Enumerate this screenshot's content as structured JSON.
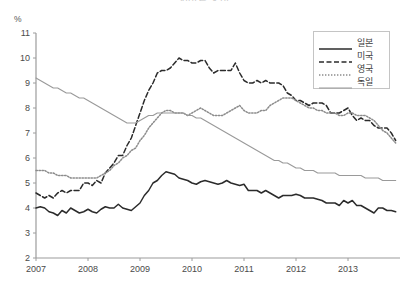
{
  "title": "실업률 추이",
  "y_unit": "%",
  "legend": {
    "position": "top-right",
    "entries": [
      {
        "label": "일본",
        "style": "solid",
        "color": "#2b2b2b",
        "width": 1.5
      },
      {
        "label": "미국",
        "style": "dashed",
        "color": "#2b2b2b",
        "width": 1.5
      },
      {
        "label": "영국",
        "style": "dotted",
        "color": "#8c8c8c",
        "width": 1.4
      },
      {
        "label": "독일",
        "style": "solid",
        "color": "#9a9a9a",
        "width": 1.2
      }
    ]
  },
  "axes": {
    "y_ticks": [
      2,
      3,
      4,
      5,
      6,
      7,
      8,
      9,
      10,
      11
    ],
    "x_ticks": [
      "2007",
      "2008",
      "2009",
      "2010",
      "2011",
      "2012",
      "2013"
    ],
    "ylim": [
      2,
      11
    ],
    "xlim": [
      2007,
      2014
    ],
    "grid": false
  },
  "chart_data": {
    "type": "line",
    "title": "실업률 추이",
    "xlabel": "",
    "ylabel": "%",
    "ylim": [
      2,
      11
    ],
    "xlim": [
      2007,
      2014
    ],
    "grid": false,
    "legend_position": "top-right",
    "x": [
      2007.0,
      2007.083,
      2007.167,
      2007.25,
      2007.333,
      2007.417,
      2007.5,
      2007.583,
      2007.667,
      2007.75,
      2007.833,
      2007.917,
      2008.0,
      2008.083,
      2008.167,
      2008.25,
      2008.333,
      2008.417,
      2008.5,
      2008.583,
      2008.667,
      2008.75,
      2008.833,
      2008.917,
      2009.0,
      2009.083,
      2009.167,
      2009.25,
      2009.333,
      2009.417,
      2009.5,
      2009.583,
      2009.667,
      2009.75,
      2009.833,
      2009.917,
      2010.0,
      2010.083,
      2010.167,
      2010.25,
      2010.333,
      2010.417,
      2010.5,
      2010.583,
      2010.667,
      2010.75,
      2010.833,
      2010.917,
      2011.0,
      2011.083,
      2011.167,
      2011.25,
      2011.333,
      2011.417,
      2011.5,
      2011.583,
      2011.667,
      2011.75,
      2011.833,
      2011.917,
      2012.0,
      2012.083,
      2012.167,
      2012.25,
      2012.333,
      2012.417,
      2012.5,
      2012.583,
      2012.667,
      2012.75,
      2012.833,
      2012.917,
      2013.0,
      2013.083,
      2013.167,
      2013.25,
      2013.333,
      2013.417,
      2013.5,
      2013.583,
      2013.667,
      2013.75,
      2013.833,
      2013.917
    ],
    "series": [
      {
        "name": "일본",
        "style": "solid",
        "color": "#2b2b2b",
        "values": [
          4.0,
          4.05,
          4.0,
          3.85,
          3.8,
          3.7,
          3.9,
          3.8,
          4.0,
          3.9,
          3.8,
          3.85,
          3.95,
          3.85,
          3.8,
          3.95,
          4.05,
          4.0,
          4.0,
          4.15,
          4.0,
          3.95,
          3.9,
          4.05,
          4.2,
          4.5,
          4.7,
          5.0,
          5.1,
          5.3,
          5.45,
          5.4,
          5.35,
          5.2,
          5.15,
          5.1,
          5.0,
          4.95,
          5.05,
          5.1,
          5.05,
          5.0,
          4.95,
          5.0,
          5.1,
          5.0,
          4.95,
          4.9,
          4.95,
          4.7,
          4.7,
          4.7,
          4.6,
          4.7,
          4.6,
          4.5,
          4.4,
          4.5,
          4.5,
          4.5,
          4.55,
          4.5,
          4.4,
          4.4,
          4.4,
          4.35,
          4.3,
          4.2,
          4.2,
          4.2,
          4.1,
          4.3,
          4.2,
          4.3,
          4.1,
          4.1,
          4.0,
          3.9,
          3.8,
          4.0,
          4.0,
          3.9,
          3.9,
          3.85
        ]
      },
      {
        "name": "미국",
        "style": "dashed",
        "color": "#2b2b2b",
        "values": [
          4.6,
          4.5,
          4.4,
          4.5,
          4.4,
          4.6,
          4.7,
          4.6,
          4.7,
          4.7,
          4.7,
          5.0,
          5.0,
          4.9,
          5.1,
          5.0,
          5.4,
          5.6,
          5.8,
          6.1,
          6.1,
          6.5,
          6.8,
          7.3,
          7.8,
          8.3,
          8.7,
          9.0,
          9.4,
          9.5,
          9.5,
          9.6,
          9.8,
          10.0,
          9.9,
          9.9,
          9.8,
          9.8,
          9.9,
          9.9,
          9.6,
          9.4,
          9.5,
          9.5,
          9.5,
          9.5,
          9.8,
          9.4,
          9.1,
          9.0,
          9.0,
          9.1,
          9.0,
          9.1,
          9.0,
          9.0,
          9.0,
          8.9,
          8.6,
          8.5,
          8.3,
          8.3,
          8.2,
          8.1,
          8.2,
          8.2,
          8.2,
          8.1,
          7.8,
          7.8,
          7.8,
          7.9,
          8.0,
          7.7,
          7.5,
          7.6,
          7.5,
          7.5,
          7.3,
          7.2,
          7.2,
          7.2,
          7.0,
          6.7
        ]
      },
      {
        "name": "영국",
        "style": "dotted",
        "color": "#8c8c8c",
        "values": [
          5.5,
          5.5,
          5.5,
          5.4,
          5.4,
          5.3,
          5.3,
          5.3,
          5.2,
          5.2,
          5.2,
          5.2,
          5.2,
          5.2,
          5.2,
          5.3,
          5.4,
          5.5,
          5.7,
          5.8,
          6.0,
          6.1,
          6.3,
          6.4,
          6.7,
          6.9,
          7.2,
          7.4,
          7.6,
          7.8,
          7.9,
          7.9,
          7.8,
          7.8,
          7.8,
          7.7,
          7.8,
          7.9,
          8.0,
          7.9,
          7.8,
          7.7,
          7.7,
          7.7,
          7.8,
          7.9,
          8.0,
          8.1,
          7.9,
          7.8,
          7.8,
          7.8,
          7.9,
          7.9,
          8.1,
          8.2,
          8.3,
          8.4,
          8.4,
          8.4,
          8.3,
          8.2,
          8.1,
          8.0,
          8.0,
          7.9,
          7.9,
          7.8,
          7.8,
          7.8,
          7.7,
          7.7,
          7.8,
          7.8,
          7.7,
          7.7,
          7.7,
          7.6,
          7.5,
          7.3,
          7.1,
          7.0,
          6.8,
          6.6
        ]
      },
      {
        "name": "독일",
        "style": "solid",
        "color": "#9a9a9a",
        "values": [
          9.2,
          9.1,
          9.0,
          8.9,
          8.8,
          8.8,
          8.7,
          8.6,
          8.6,
          8.5,
          8.4,
          8.4,
          8.3,
          8.2,
          8.1,
          8.0,
          7.9,
          7.8,
          7.7,
          7.6,
          7.5,
          7.4,
          7.4,
          7.4,
          7.5,
          7.6,
          7.7,
          7.7,
          7.8,
          7.8,
          7.8,
          7.8,
          7.8,
          7.8,
          7.8,
          7.7,
          7.7,
          7.6,
          7.6,
          7.5,
          7.4,
          7.3,
          7.2,
          7.1,
          7.0,
          6.9,
          6.8,
          6.7,
          6.6,
          6.5,
          6.4,
          6.3,
          6.2,
          6.1,
          6.0,
          5.9,
          5.9,
          5.8,
          5.8,
          5.7,
          5.6,
          5.6,
          5.5,
          5.5,
          5.5,
          5.4,
          5.4,
          5.4,
          5.4,
          5.4,
          5.3,
          5.3,
          5.3,
          5.3,
          5.3,
          5.3,
          5.2,
          5.2,
          5.2,
          5.2,
          5.1,
          5.1,
          5.1,
          5.1
        ]
      }
    ]
  }
}
